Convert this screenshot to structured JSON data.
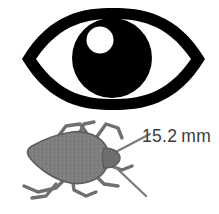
{
  "figure": {
    "name": "eye-and-stink-bug-size-comparison",
    "background_color": "#ffffff",
    "width": 219,
    "height": 214
  },
  "eye": {
    "icon_name": "eye-icon",
    "outline_color": "#000000",
    "pupil_color": "#000000",
    "highlight_color": "#ffffff",
    "sclera_color": "#ffffff"
  },
  "bug": {
    "icon_name": "stink-bug-icon",
    "common_name": "stink bug",
    "body_color": "#7e7e7e",
    "body_texture_color": "#6a6a6a",
    "outline_color": "#5a5a5a",
    "leg_color": "#6f6f6f"
  },
  "measurement": {
    "value": "15.2",
    "unit": "mm",
    "full_label": "15.2 mm",
    "text_color": "#3b3b3b"
  }
}
